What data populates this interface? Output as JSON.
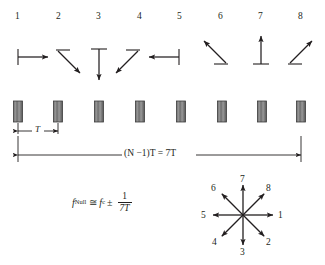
{
  "figure": {
    "title_none": "",
    "element_indices": [
      "1",
      "2",
      "3",
      "4",
      "5",
      "6",
      "7",
      "8"
    ],
    "phase_arrows": [
      {
        "index": "1",
        "direction": "right",
        "angle_deg": 0
      },
      {
        "index": "2",
        "direction": "down-right",
        "angle_deg": -45
      },
      {
        "index": "3",
        "direction": "down",
        "angle_deg": -90
      },
      {
        "index": "4",
        "direction": "down-left",
        "angle_deg": -135
      },
      {
        "index": "5",
        "direction": "left",
        "angle_deg": 180
      },
      {
        "index": "6",
        "direction": "up-left",
        "angle_deg": 135
      },
      {
        "index": "7",
        "direction": "up",
        "angle_deg": 90
      },
      {
        "index": "8",
        "direction": "up-right",
        "angle_deg": 45
      }
    ],
    "element_count": 8,
    "spacing_label": "T",
    "total_length_label": "(N −1)T = 7T",
    "total_length_parts": {
      "n_minus_one": "(N −1)",
      "t1": "T",
      "equals": "=",
      "seven_t": "7T"
    },
    "formula": {
      "lhs_symbol": "f",
      "lhs_subscript": "Null",
      "approx_equal": "≅",
      "rhs_symbol": "f",
      "rhs_subscript": "c",
      "plus_minus": "±",
      "fraction_numerator": "1",
      "fraction_denominator": "7T",
      "full_text": "f_Null ≅ f_c ± 1/(7T)"
    },
    "phasor_star": {
      "spokes": [
        {
          "label": "1",
          "angle_deg": 0
        },
        {
          "label": "2",
          "angle_deg": -45
        },
        {
          "label": "3",
          "angle_deg": -90
        },
        {
          "label": "4",
          "angle_deg": -135
        },
        {
          "label": "5",
          "angle_deg": 180
        },
        {
          "label": "6",
          "angle_deg": 135
        },
        {
          "label": "7",
          "angle_deg": 90
        },
        {
          "label": "8",
          "angle_deg": 45
        }
      ],
      "spoke_count": 8
    },
    "colors": {
      "ink": "#231f20",
      "line": "#231f20",
      "element_fill": "#8a8a8a",
      "element_stroke": "#3d3d3d",
      "background": "#ffffff"
    }
  }
}
